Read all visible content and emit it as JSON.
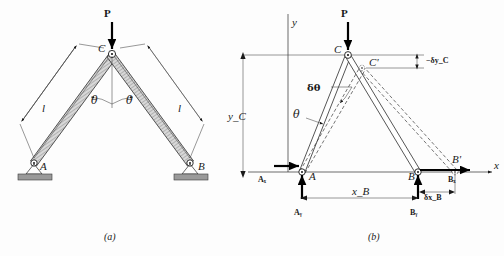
{
  "figure": {
    "panels": [
      {
        "id": "a",
        "caption": "(a)",
        "labels": {
          "load": "P",
          "apex": "C",
          "support_left": "A",
          "support_right": "B",
          "length_left": "l",
          "length_right": "l",
          "angle_left": "θ",
          "angle_right": "θ"
        }
      },
      {
        "id": "b",
        "caption": "(b)",
        "labels": {
          "axis_y": "y",
          "axis_x": "x",
          "load": "P",
          "apex": "C",
          "apex_displaced": "C'",
          "pin_left": "A",
          "pin_right": "B",
          "pin_right_displaced": "B'",
          "reaction_ax": "Aₓ",
          "reaction_ay": "Aᵧ",
          "reaction_bx": "Bₓ",
          "reaction_by": "Bᵧ",
          "dim_yc": "y_C",
          "dim_xb": "x_B",
          "virtual_angle": "δθ",
          "virtual_dyc": "−δy_C",
          "virtual_dxb": "δx_B"
        }
      }
    ],
    "colors": {
      "ink": "#1a1a1a",
      "member_fill_a": "#d8d8d8",
      "member_fill_b": "#ffffff",
      "ground": "#9a9a9a",
      "force_arrow": "#000000",
      "dashed": "#3a3a3a"
    }
  }
}
